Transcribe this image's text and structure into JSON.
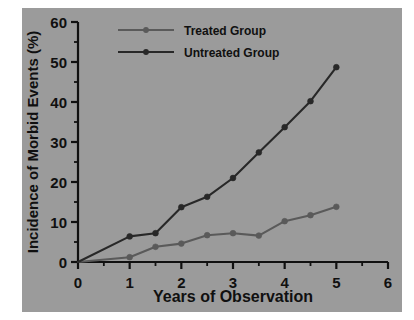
{
  "figure": {
    "background_color": "#ffffff",
    "plate_color": "#9b9b9b"
  },
  "chart_data": {
    "type": "line",
    "title": "",
    "subtitle": "",
    "xlabel": "Years of Observation",
    "ylabel": "Incidence of Morbid Events (%)",
    "xlim": [
      0,
      6
    ],
    "ylim": [
      0,
      60
    ],
    "xticks": [
      0,
      1,
      2,
      3,
      4,
      5,
      6
    ],
    "xtick_labels": [
      "0",
      "1",
      "2",
      "3",
      "4",
      "5",
      "6"
    ],
    "x_minor_tick_step": 0.5,
    "yticks": [
      0,
      10,
      20,
      30,
      40,
      50,
      60
    ],
    "ytick_labels": [
      "0",
      "10",
      "20",
      "30",
      "40",
      "50",
      "60"
    ],
    "y_minor_tick_step": 5,
    "grid": false,
    "legend_position": "top-left-inside",
    "x": [
      0,
      1,
      1.5,
      2,
      2.5,
      3,
      3.5,
      4,
      4.5,
      5
    ],
    "series": [
      {
        "name": "Treated Group",
        "color": "#5a5a5a",
        "marker": "circle",
        "values": [
          0,
          1.2,
          3.8,
          4.6,
          6.7,
          7.2,
          6.6,
          10.2,
          11.7,
          13.8
        ]
      },
      {
        "name": "Untreated Group",
        "color": "#282828",
        "marker": "circle",
        "values": [
          0,
          6.4,
          7.2,
          13.7,
          16.3,
          21.0,
          27.4,
          33.7,
          40.2,
          48.7
        ]
      }
    ],
    "annotations": []
  },
  "legend": {
    "entries": [
      {
        "label": "Treated Group",
        "color": "#5a5a5a"
      },
      {
        "label": "Untreated Group",
        "color": "#282828"
      }
    ]
  },
  "axes": {
    "x_title": "Years of Observation",
    "y_title": "Incidence of Morbid Events (%)",
    "axis_color": "#101010"
  }
}
